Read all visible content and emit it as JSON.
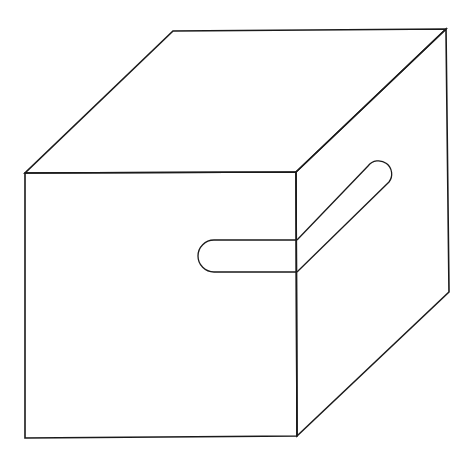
{
  "puzzle": {
    "type": "word-search-cube",
    "top_face": {
      "rows": [
        [
          "T",
          "L",
          "O",
          "D",
          "B",
          "B",
          "T",
          "R"
        ],
        [
          "I",
          "R",
          "S",
          "I",
          "G",
          "A",
          "H",
          "H"
        ],
        [
          "A",
          "M",
          "A",
          "L",
          "I",
          "R",
          "A",
          "D"
        ],
        [
          "P",
          "C",
          "T",
          "P",
          "M",
          "B",
          "S",
          "B"
        ],
        [
          "E",
          "V",
          "I",
          "R",
          "O",
          "A",
          "C",
          "E"
        ],
        [
          "S",
          "P",
          "G",
          "T",
          "R",
          "S",
          "O",
          "P"
        ],
        [
          "A",
          "U",
          "E",
          "A",
          "T",
          "V",
          "S",
          "I"
        ],
        [
          "P",
          "L",
          "A",
          "N",
          "A",
          "U",
          "L",
          "N"
        ]
      ]
    },
    "front_face": {
      "rows": [
        [
          "S",
          "G",
          "D",
          "L",
          "U",
          "C",
          "R",
          "T"
        ],
        [
          "I",
          "A",
          "C",
          "N",
          "C",
          "L",
          "B",
          "U"
        ],
        [
          "H",
          "S",
          "L",
          "Q",
          "V",
          "T",
          "O",
          "R"
        ],
        [
          "C",
          "L",
          "G",
          "M",
          "E",
          "N",
          "A",
          "A"
        ],
        [
          "M",
          "I",
          "G",
          "A",
          "S",
          "C",
          "B",
          "P"
        ],
        [
          "M",
          "D",
          "T",
          "O",
          "M",
          "G",
          "L",
          "O"
        ],
        [
          "L",
          "A",
          "N",
          "Z",
          "U",
          "E",
          "L",
          "O"
        ],
        [
          "P",
          "D",
          "N",
          "V",
          "M",
          "O",
          "M",
          "N"
        ]
      ]
    },
    "right_face": {
      "columns": [
        [
          "A",
          "R",
          "N",
          "L",
          "O",
          "D",
          "C",
          "P"
        ],
        [
          "I",
          "L",
          "I",
          "O",
          "V",
          "I",
          "D",
          "A"
        ],
        [
          "V",
          "L",
          "L",
          "G",
          "E",
          "N",
          "O",
          "M"
        ],
        [
          "M",
          "S",
          "L",
          "T",
          "V",
          "X",
          "G",
          "F"
        ],
        [
          "O",
          "O",
          "O",
          "P",
          "A",
          "P",
          "A",
          "Y"
        ],
        [
          "E",
          "D",
          "O",
          "S",
          "B",
          "O",
          "L",
          "D"
        ],
        [
          "G",
          "R",
          "A",
          "C",
          "T",
          "D",
          "E",
          "M"
        ],
        [
          "A",
          "G",
          "O",
          "F",
          "Q",
          "L",
          "H",
          "S"
        ]
      ]
    },
    "found_words": [
      {
        "word": "TORNILLO",
        "front_cells": "row 3, cols 6-8",
        "right_cells": "row 3 diagonal, cols 1-5"
      }
    ]
  }
}
